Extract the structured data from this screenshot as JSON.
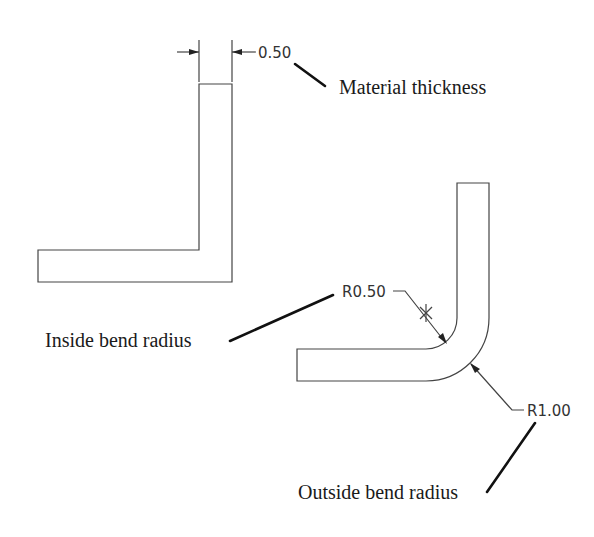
{
  "diagram": {
    "dimensions": {
      "thickness": "0.50",
      "inside_radius": "R0.50",
      "outside_radius": "R1.00"
    },
    "labels": {
      "material_thickness": "Material thickness",
      "inside_bend_radius": "Inside bend radius",
      "outside_bend_radius": "Outside bend radius"
    },
    "parts": [
      {
        "name": "sharp-corner-angle",
        "description": "L-shaped part with sharp corner"
      },
      {
        "name": "radiused-bend-angle",
        "description": "L-shaped part with radiused bend"
      }
    ],
    "colors": {
      "line": "#444444",
      "leader": "#111111",
      "background": "#ffffff"
    }
  }
}
